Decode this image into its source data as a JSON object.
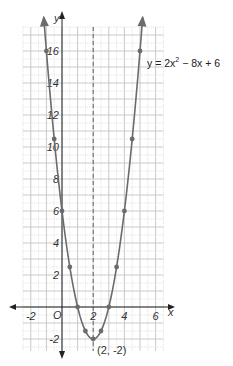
{
  "chart_data": {
    "type": "line",
    "title": "",
    "equation": "y = 2x² − 8x + 6",
    "equation_parts": {
      "lhs": "y = 2x",
      "exp": "2",
      "rhs": " − 8x + 6"
    },
    "xlabel": "x",
    "ylabel": "y",
    "origin_label": "O",
    "xlim": [
      -2.5,
      6.5
    ],
    "ylim": [
      -2.75,
      17.5
    ],
    "grid": true,
    "grid_step": 0.5,
    "x_ticks": [
      -2,
      2,
      4,
      6
    ],
    "y_ticks": [
      -2,
      2,
      4,
      6,
      8,
      10,
      12,
      14,
      16
    ],
    "axis_of_symmetry": {
      "x": 2,
      "style": "dashed"
    },
    "vertex": {
      "x": 2,
      "y": -2,
      "label": "(2, -2)"
    },
    "series": [
      {
        "name": "y = 2x² − 8x + 6",
        "points": [
          {
            "x": -1,
            "y": 16
          },
          {
            "x": -0.5,
            "y": 10.5
          },
          {
            "x": 0,
            "y": 6
          },
          {
            "x": 0.5,
            "y": 2.5
          },
          {
            "x": 1,
            "y": 0
          },
          {
            "x": 1.5,
            "y": -1.5
          },
          {
            "x": 2,
            "y": -2
          },
          {
            "x": 2.5,
            "y": -1.5
          },
          {
            "x": 3,
            "y": 0
          },
          {
            "x": 3.5,
            "y": 2.5
          },
          {
            "x": 4,
            "y": 6
          },
          {
            "x": 4.5,
            "y": 10.5
          },
          {
            "x": 5,
            "y": 16
          }
        ],
        "coefficients": {
          "a": 2,
          "b": -8,
          "c": 6
        },
        "color": "#6b6b6b"
      }
    ],
    "colors": {
      "curve": "#6b6b6b",
      "axis": "#222222",
      "grid_major": "#bdbdbd",
      "grid_minor": "#d8d8d8",
      "point": "#6b6b6b"
    }
  }
}
